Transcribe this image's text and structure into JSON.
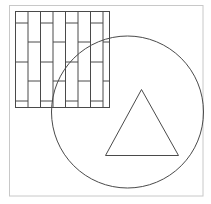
{
  "canvas": {
    "width": 211,
    "height": 204,
    "background": "#ffffff"
  },
  "colors": {
    "frame": "#c8c8c8",
    "stroke": "#4a4a4a"
  },
  "frame": {
    "x": 9.5,
    "y": 5.5,
    "width": 193.5,
    "height": 190.5
  },
  "brick_square": {
    "x": 15.5,
    "y": 11.5,
    "width": 94,
    "height": 96,
    "columns_x": [
      15.5,
      28,
      40.5,
      53,
      65.5,
      78,
      90.5,
      103,
      109.5
    ],
    "rows_odd_y": [
      23,
      62,
      101
    ],
    "rows_even_y": [
      42,
      81
    ]
  },
  "circle": {
    "cx": 127.5,
    "cy": 112,
    "r": 76
  },
  "triangle": {
    "points": [
      [
        141.5,
        89.5
      ],
      [
        105.5,
        155.5
      ],
      [
        178.5,
        155.5
      ]
    ]
  }
}
